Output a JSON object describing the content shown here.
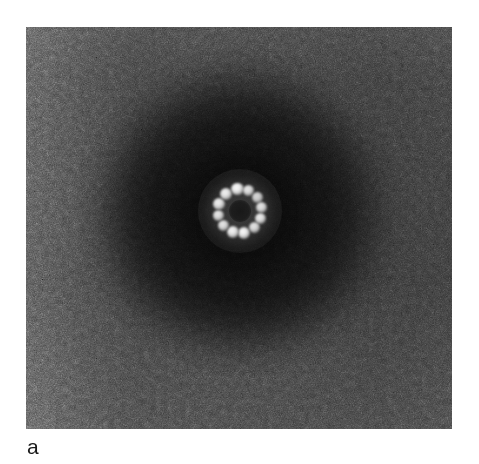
{
  "figure": {
    "kind": "electron-micrograph",
    "panel_label": "a",
    "background_color": "#ffffff"
  },
  "micrograph": {
    "alt_text": "Negative-stain electron micrograph of a single ring-shaped macromolecular particle",
    "panel": {
      "x": 26,
      "y": 27,
      "width": 426,
      "height": 402,
      "base_tone": "#3a3a3a",
      "darkest_tone": "#0a0a0a",
      "lightest_tone": "#8c8c8c"
    },
    "halo": {
      "center_x_pct": 50.2,
      "center_y_pct": 46.0,
      "radius_px": 168,
      "description": "broad dark stain-excluded disc surrounding the particle"
    },
    "grain": {
      "type": "film-grain",
      "description": "fine stochastic speckle typical of negative-stain EM film"
    }
  },
  "chart_data": {
    "type": "heatmap",
    "title": "",
    "xlabel": "",
    "ylabel": "",
    "particle": {
      "center": [
        240,
        211
      ],
      "ring_radius_px": 22,
      "lumen_radius_px": 9,
      "subunit_count": 12,
      "subunit_radius_px": 6.0,
      "subunits": [
        {
          "index": 1,
          "angle_deg": -97,
          "cx": 237.3,
          "cy": 189.2,
          "r": 6.2,
          "brightness": 0.97
        },
        {
          "index": 2,
          "angle_deg": -67,
          "cx": 248.6,
          "cy": 190.8,
          "r": 5.6,
          "brightness": 0.88
        },
        {
          "index": 3,
          "angle_deg": -38,
          "cx": 257.3,
          "cy": 197.4,
          "r": 5.4,
          "brightness": 0.8
        },
        {
          "index": 4,
          "angle_deg": -10,
          "cx": 261.7,
          "cy": 207.2,
          "r": 5.6,
          "brightness": 0.86
        },
        {
          "index": 5,
          "angle_deg": 20,
          "cx": 260.7,
          "cy": 218.5,
          "r": 5.8,
          "brightness": 0.9
        },
        {
          "index": 6,
          "angle_deg": 50,
          "cx": 254.1,
          "cy": 227.9,
          "r": 5.6,
          "brightness": 0.86
        },
        {
          "index": 7,
          "angle_deg": 80,
          "cx": 243.8,
          "cy": 232.7,
          "r": 6.2,
          "brightness": 0.96
        },
        {
          "index": 8,
          "angle_deg": 110,
          "cx": 232.5,
          "cy": 231.7,
          "r": 6.0,
          "brightness": 0.94
        },
        {
          "index": 9,
          "angle_deg": 140,
          "cx": 223.1,
          "cy": 225.1,
          "r": 5.6,
          "brightness": 0.87
        },
        {
          "index": 10,
          "angle_deg": 168,
          "cx": 218.5,
          "cy": 215.6,
          "r": 5.6,
          "brightness": 0.88
        },
        {
          "index": 11,
          "angle_deg": -162,
          "cx": 219.1,
          "cy": 204.2,
          "r": 5.8,
          "brightness": 0.91
        },
        {
          "index": 12,
          "angle_deg": -130,
          "cx": 225.9,
          "cy": 194.1,
          "r": 6.0,
          "brightness": 0.93
        }
      ],
      "lumen_intensity": 0.12,
      "background_intensity": 0.08
    },
    "intensity_scale": {
      "min": 0.0,
      "max": 1.0,
      "colormap": "grayscale"
    },
    "grid": false,
    "legend": false
  }
}
